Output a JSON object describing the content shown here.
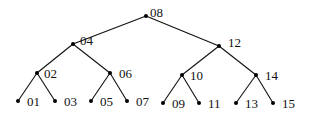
{
  "diagram": {
    "type": "binary-tree",
    "colors": {
      "edge": "#111111",
      "node": "#000000",
      "label": "#111111",
      "background": "#ffffff"
    },
    "nodes": [
      {
        "id": "08",
        "label": "08",
        "x": 146,
        "y": 16,
        "lx": 4,
        "ly": 4
      },
      {
        "id": "04",
        "label": "04",
        "x": 73,
        "y": 44,
        "lx": 7,
        "ly": 4
      },
      {
        "id": "12",
        "label": "12",
        "x": 219,
        "y": 46,
        "lx": 9,
        "ly": 4
      },
      {
        "id": "02",
        "label": "02",
        "x": 37,
        "y": 73,
        "lx": 7,
        "ly": 0
      },
      {
        "id": "06",
        "label": "06",
        "x": 110,
        "y": 73,
        "lx": 9,
        "ly": 0
      },
      {
        "id": "10",
        "label": "10",
        "x": 182,
        "y": 75,
        "lx": 8,
        "ly": 0
      },
      {
        "id": "14",
        "label": "14",
        "x": 256,
        "y": 75,
        "lx": 9,
        "ly": 0
      },
      {
        "id": "01",
        "label": "01",
        "x": 18,
        "y": 101,
        "lx": 9,
        "ly": 0
      },
      {
        "id": "03",
        "label": "03",
        "x": 55,
        "y": 101,
        "lx": 9,
        "ly": 0
      },
      {
        "id": "05",
        "label": "05",
        "x": 91,
        "y": 101,
        "lx": 9,
        "ly": 0
      },
      {
        "id": "07",
        "label": "07",
        "x": 127,
        "y": 101,
        "lx": 9,
        "ly": 0
      },
      {
        "id": "09",
        "label": "09",
        "x": 163,
        "y": 103,
        "lx": 9,
        "ly": 0
      },
      {
        "id": "11",
        "label": "11",
        "x": 199,
        "y": 103,
        "lx": 9,
        "ly": 0
      },
      {
        "id": "13",
        "label": "13",
        "x": 236,
        "y": 103,
        "lx": 9,
        "ly": 0
      },
      {
        "id": "15",
        "label": "15",
        "x": 273,
        "y": 103,
        "lx": 9,
        "ly": 0
      }
    ],
    "edges": [
      [
        "08",
        "04"
      ],
      [
        "08",
        "12"
      ],
      [
        "04",
        "02"
      ],
      [
        "04",
        "06"
      ],
      [
        "12",
        "10"
      ],
      [
        "12",
        "14"
      ],
      [
        "02",
        "01"
      ],
      [
        "02",
        "03"
      ],
      [
        "06",
        "05"
      ],
      [
        "06",
        "07"
      ],
      [
        "10",
        "09"
      ],
      [
        "10",
        "11"
      ],
      [
        "14",
        "13"
      ],
      [
        "14",
        "15"
      ]
    ]
  }
}
